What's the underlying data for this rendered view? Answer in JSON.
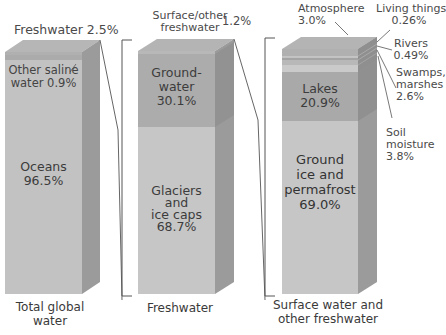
{
  "bars": [
    {
      "caption_line1": "Total global",
      "caption_line2": "water",
      "top_label": "Freshwater 2.5%",
      "segments": [
        {
          "name": "Other saline water",
          "label_line1": "Other saline",
          "label_line2": "water 0.9%",
          "value": 0.9
        },
        {
          "name": "Oceans",
          "label_line1": "Oceans",
          "label_line2": "96.5%",
          "value": 96.5
        },
        {
          "name": "Freshwater",
          "value": 2.5
        }
      ]
    },
    {
      "caption": "Freshwater",
      "top_label_line1": "Surface/other",
      "top_label_line2": "freshwater",
      "top_label_value": "1.2%",
      "segments": [
        {
          "name": "Groundwater",
          "label_line1": "Ground-",
          "label_line2": "water",
          "label_line3": "30.1%",
          "value": 30.1
        },
        {
          "name": "Glaciers and ice caps",
          "label_line1": "Glaciers",
          "label_line2": "and",
          "label_line3": "ice caps",
          "label_line4": "68.7%",
          "value": 68.7
        },
        {
          "name": "Surface/other freshwater",
          "value": 1.2
        }
      ]
    },
    {
      "caption_line1": "Surface water and",
      "caption_line2": "other freshwater",
      "segments": [
        {
          "name": "Atmosphere",
          "label_line1": "Atmosphere",
          "label_line2": "3.0%",
          "value": 3.0
        },
        {
          "name": "Living things",
          "label_line1": "Living things",
          "label_line2": "0.26%",
          "value": 0.26
        },
        {
          "name": "Rivers",
          "label_line1": "Rivers",
          "label_line2": "0.49%",
          "value": 0.49
        },
        {
          "name": "Swamps, marshes",
          "label_line1": "Swamps,",
          "label_line2": "marshes",
          "label_line3": "2.6%",
          "value": 2.6
        },
        {
          "name": "Soil moisture",
          "label_line1": "Soil",
          "label_line2": "moisture",
          "label_line3": "3.8%",
          "value": 3.8
        },
        {
          "name": "Lakes",
          "label_line1": "Lakes",
          "label_line2": "20.9%",
          "value": 20.9
        },
        {
          "name": "Ground ice and permafrost",
          "label_line1": "Ground",
          "label_line2": "ice and",
          "label_line3": "permafrost",
          "label_line4": "69.0%",
          "value": 69.0
        }
      ]
    }
  ],
  "colors": {
    "front_light": "#c8c8c8",
    "front_mid": "#b4b4b4",
    "front_dark": "#a6a6a6",
    "side": "#9a9a9a",
    "top": "#b9b9b9",
    "line": "#555555"
  }
}
